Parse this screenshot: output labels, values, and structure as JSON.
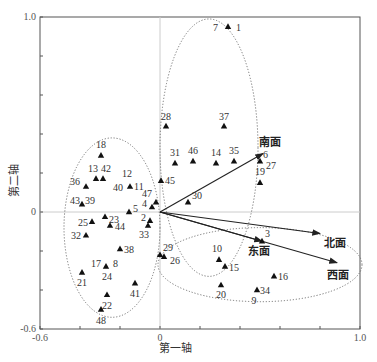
{
  "chart_data": {
    "type": "scatter",
    "subtype": "ordination-biplot",
    "title": "",
    "xlabel": "第一轴",
    "ylabel": "第二轴",
    "xlim": [
      -0.6,
      1.0
    ],
    "ylim": [
      -0.6,
      1.0
    ],
    "x_tick_labels": [
      "-0.6",
      "0",
      "1.0"
    ],
    "y_tick_labels": [
      "1.0",
      "0",
      "-0.6"
    ],
    "grid": false,
    "zero_lines": true,
    "legend": null,
    "marker": "triangle",
    "points": [
      {
        "label": "7",
        "x": 0.34,
        "y": 0.95
      },
      {
        "label": "1",
        "x": 0.36,
        "y": 0.95
      },
      {
        "label": "28",
        "x": 0.03,
        "y": 0.44
      },
      {
        "label": "37",
        "x": 0.32,
        "y": 0.44
      },
      {
        "label": "31",
        "x": 0.075,
        "y": 0.25
      },
      {
        "label": "46",
        "x": 0.165,
        "y": 0.26
      },
      {
        "label": "14",
        "x": 0.28,
        "y": 0.25
      },
      {
        "label": "35",
        "x": 0.37,
        "y": 0.26
      },
      {
        "label": "6",
        "x": 0.5,
        "y": 0.26
      },
      {
        "label": "27",
        "x": 0.51,
        "y": 0.25
      },
      {
        "label": "19",
        "x": 0.5,
        "y": 0.15
      },
      {
        "label": "45",
        "x": 0.005,
        "y": 0.16
      },
      {
        "label": "30",
        "x": 0.14,
        "y": 0.05
      },
      {
        "label": "18",
        "x": -0.295,
        "y": 0.29
      },
      {
        "label": "13",
        "x": -0.32,
        "y": 0.17
      },
      {
        "label": "42",
        "x": -0.285,
        "y": 0.17
      },
      {
        "label": "36",
        "x": -0.37,
        "y": 0.13
      },
      {
        "label": "12",
        "x": -0.165,
        "y": 0.13
      },
      {
        "label": "40",
        "x": -0.165,
        "y": 0.13
      },
      {
        "label": "11",
        "x": -0.15,
        "y": 0.13
      },
      {
        "label": "47",
        "x": -0.02,
        "y": 0.05
      },
      {
        "label": "4",
        "x": -0.04,
        "y": 0.025
      },
      {
        "label": "5",
        "x": -0.155,
        "y": 0.0
      },
      {
        "label": "43",
        "x": -0.39,
        "y": 0.04
      },
      {
        "label": "39",
        "x": -0.385,
        "y": 0.04
      },
      {
        "label": "23",
        "x": -0.275,
        "y": -0.025
      },
      {
        "label": "25",
        "x": -0.34,
        "y": -0.05
      },
      {
        "label": "44",
        "x": -0.25,
        "y": -0.07
      },
      {
        "label": "2",
        "x": -0.05,
        "y": -0.045
      },
      {
        "label": "33",
        "x": -0.06,
        "y": -0.07
      },
      {
        "label": "32",
        "x": -0.37,
        "y": -0.12
      },
      {
        "label": "38",
        "x": -0.2,
        "y": -0.19
      },
      {
        "label": "29",
        "x": 0.0,
        "y": -0.22
      },
      {
        "label": "26",
        "x": 0.02,
        "y": -0.23
      },
      {
        "label": "17",
        "x": -0.27,
        "y": -0.28
      },
      {
        "label": "8",
        "x": -0.26,
        "y": -0.28
      },
      {
        "label": "24",
        "x": -0.265,
        "y": -0.28
      },
      {
        "label": "21",
        "x": -0.39,
        "y": -0.31
      },
      {
        "label": "41",
        "x": -0.125,
        "y": -0.365
      },
      {
        "label": "22",
        "x": -0.265,
        "y": -0.425
      },
      {
        "label": "48",
        "x": -0.295,
        "y": -0.5
      },
      {
        "label": "3",
        "x": 0.51,
        "y": -0.15
      },
      {
        "label": "10",
        "x": 0.295,
        "y": -0.245
      },
      {
        "label": "15",
        "x": 0.325,
        "y": -0.28
      },
      {
        "label": "16",
        "x": 0.57,
        "y": -0.33
      },
      {
        "label": "20",
        "x": 0.305,
        "y": -0.375
      },
      {
        "label": "34",
        "x": 0.485,
        "y": -0.4
      },
      {
        "label": "9",
        "x": 0.48,
        "y": -0.405
      }
    ],
    "vectors": [
      {
        "label": "南面",
        "x": 0.515,
        "y": 0.3
      },
      {
        "label": "北面",
        "x": 0.8,
        "y": -0.11
      },
      {
        "label": "东面",
        "x": 0.51,
        "y": -0.15
      },
      {
        "label": "西面",
        "x": 0.885,
        "y": -0.26
      }
    ],
    "groups": [
      {
        "name": "upper-group",
        "shape": "dotted-ellipse",
        "cx": 0.245,
        "cy": 0.33,
        "rx": 0.245,
        "ry": 0.66
      },
      {
        "name": "left-group",
        "shape": "dotted-ellipse",
        "cx": -0.24,
        "cy": -0.08,
        "rx": 0.24,
        "ry": 0.46
      },
      {
        "name": "lower-right-group",
        "shape": "dotted-ellipse",
        "cx": 0.5,
        "cy": -0.27,
        "rx": 0.51,
        "ry": 0.19
      }
    ]
  }
}
